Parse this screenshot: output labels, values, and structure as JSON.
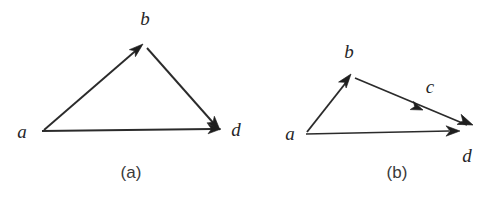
{
  "figure": {
    "kind": "directed-graph-diagram",
    "background_color": "#ffffff",
    "stroke_color": "#2b2b2b",
    "arrow_fill_color": "#1e1e1e",
    "label_color": "#262626",
    "caption_color": "#3a3a3a"
  },
  "panels": [
    {
      "id": "panel-a",
      "caption": "(a)",
      "caption_pos": {
        "x": 131,
        "y": 177
      },
      "nodes": [
        {
          "id": "a",
          "label": "a",
          "x": 40,
          "y": 132,
          "label_x": 22,
          "label_y": 138
        },
        {
          "id": "b",
          "label": "b",
          "x": 143,
          "y": 44,
          "label_x": 144,
          "label_y": 25
        },
        {
          "id": "d",
          "label": "d",
          "x": 219,
          "y": 129,
          "label_x": 231,
          "label_y": 136
        }
      ],
      "edges": [
        {
          "from": "a",
          "to": "b",
          "arrow_at_end": true,
          "mid_arrow": false
        },
        {
          "from": "b",
          "to": "d",
          "arrow_at_end": true,
          "mid_arrow": false
        },
        {
          "from": "a",
          "to": "d",
          "arrow_at_end": true,
          "mid_arrow": false
        }
      ]
    },
    {
      "id": "panel-b",
      "caption": "(b)",
      "caption_pos": {
        "x": 397,
        "y": 177
      },
      "nodes": [
        {
          "id": "a",
          "label": "a",
          "x": 304,
          "y": 134,
          "label_x": 290,
          "label_y": 139
        },
        {
          "id": "b",
          "label": "b",
          "x": 351,
          "y": 75,
          "label_x": 348,
          "label_y": 57
        },
        {
          "id": "c",
          "label": "c",
          "x": 418,
          "y": 108,
          "label_x": 427,
          "label_y": 92
        },
        {
          "id": "d",
          "label": "d",
          "x": 470,
          "y": 127,
          "label_x": 463,
          "label_y": 161
        }
      ],
      "edges": [
        {
          "from": "a",
          "to": "b",
          "arrow_at_end": true,
          "mid_arrow": false
        },
        {
          "from": "b",
          "to": "d",
          "arrow_at_end": true,
          "mid_arrow": true,
          "mid_label": "c"
        },
        {
          "from": "a",
          "to": "d",
          "arrow_at_end": true,
          "mid_arrow": false
        }
      ]
    }
  ],
  "geometry": {
    "panel_a": {
      "edge_ab": {
        "x1": 44,
        "y1": 130,
        "x2": 140,
        "y2": 47
      },
      "edge_bd": {
        "x1": 147,
        "y1": 48,
        "x2": 216,
        "y2": 125
      },
      "edge_ad": {
        "x1": 42,
        "y1": 131,
        "x2": 211,
        "y2": 129
      },
      "arrow_b": {
        "x": 143,
        "y": 44,
        "angle": -40.8,
        "size": 13
      },
      "arrow_d_from_b": {
        "x": 220,
        "y": 129,
        "angle": 48.0,
        "size": 13
      },
      "arrow_d_from_a": {
        "x": 218,
        "y": 129,
        "angle": 0.0,
        "size": 12
      }
    },
    "panel_b": {
      "edge_ab": {
        "x1": 307,
        "y1": 132,
        "x2": 348,
        "y2": 79
      },
      "edge_bd": {
        "x1": 354,
        "y1": 77,
        "x2": 466,
        "y2": 124
      },
      "edge_ad": {
        "x1": 306,
        "y1": 134,
        "x2": 447,
        "y2": 131
      },
      "arrow_b": {
        "x": 351,
        "y": 74,
        "angle": -52.0,
        "size": 13
      },
      "arrow_c": {
        "x": 419,
        "y": 109,
        "angle": 22.0,
        "size": 11
      },
      "arrow_d_from_b": {
        "x": 471,
        "y": 126,
        "angle": 22.0,
        "size": 14
      },
      "arrow_d_from_a": {
        "x": 458,
        "y": 131,
        "angle": 0.0,
        "size": 13
      }
    }
  }
}
